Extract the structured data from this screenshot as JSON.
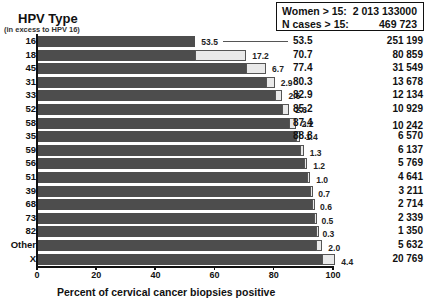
{
  "header": {
    "title": "HPV Type",
    "subtitle": "(in excess to HPV 16)"
  },
  "infobox": {
    "women_label": "Women  > 15:",
    "women_value": "2 013 133000",
    "cases_label": "N cases  > 15:",
    "cases_value": "469 723"
  },
  "axis": {
    "xlabel": "Percent of cervical cancer biopsies positive",
    "ticks": [
      "0",
      "20",
      "40",
      "60",
      "80",
      "100"
    ]
  },
  "chart_data": {
    "type": "bar",
    "orientation": "horizontal-stacked-cumulative",
    "xlabel": "Percent of cervical cancer biopsies positive",
    "ylabel": "HPV Type",
    "xlim": [
      0,
      100
    ],
    "xticks": [
      0,
      20,
      40,
      60,
      80,
      100
    ],
    "grid": false,
    "annotation": {
      "Women > 15": "2 013 133000",
      "N cases > 15": "469 723"
    },
    "categories": [
      "16",
      "18",
      "45",
      "31",
      "33",
      "52",
      "58",
      "35",
      "59",
      "56",
      "51",
      "39",
      "68",
      "73",
      "82",
      "Other",
      "X"
    ],
    "series": [
      {
        "name": "Cumulative before type (%)",
        "values": [
          0,
          53.5,
          70.7,
          77.4,
          80.3,
          82.9,
          85.2,
          87.4,
          88.8,
          90.1,
          91.3,
          92.3,
          93.0,
          93.6,
          94.1,
          94.4,
          96.4
        ]
      },
      {
        "name": "Increment (%)",
        "values": [
          53.5,
          17.2,
          6.7,
          2.9,
          2.6,
          2.3,
          2.2,
          1.4,
          1.3,
          1.2,
          1.0,
          0.7,
          0.6,
          0.5,
          0.3,
          2.0,
          4.4
        ]
      }
    ],
    "increment_labels": [
      "53.5",
      "17.2",
      "6.7",
      "2.9",
      "2.6",
      "2.3",
      "2.2",
      "1.4",
      "1.3",
      "1.2",
      "1.0",
      "0.7",
      "0.6",
      "0.5",
      "0.3",
      "2.0",
      "4.4"
    ],
    "cumulative_labels": [
      "53.5",
      "70.7",
      "77.4",
      "80.3",
      "82.9",
      "85.2",
      "87.4",
      "88.8",
      "",
      "",
      "",
      "",
      "",
      "",
      "",
      "",
      ""
    ],
    "case_counts": [
      "251 199",
      "80 859",
      "31 549",
      "13 678",
      "12 134",
      "10 929",
      "10 242",
      "6 570",
      "6 137",
      "5 769",
      "4 641",
      "3 211",
      "2 714",
      "2 339",
      "1 350",
      "5 632",
      "20 769"
    ]
  }
}
